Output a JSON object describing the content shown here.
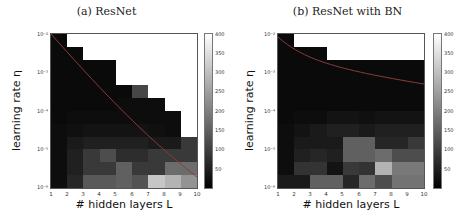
{
  "chart_data": [
    {
      "type": "heatmap",
      "title": "(a) ResNet",
      "xlabel": "# hidden layers L",
      "ylabel": "learning rate η",
      "x_ticks": [
        "1",
        "2",
        "3",
        "4",
        "5",
        "6",
        "7",
        "8",
        "9",
        "10"
      ],
      "y_ticks": [
        "10⁻²",
        "10⁻³",
        "10⁻⁴",
        "10⁻⁵",
        "10⁻⁶"
      ],
      "y_scale": "log",
      "xlim": [
        1,
        10
      ],
      "ylim": [
        1e-06,
        0.01
      ],
      "colorbar": {
        "min": 0,
        "max": 400,
        "ticks": [
          "50",
          "100",
          "150",
          "200",
          "250",
          "300",
          "350",
          "400"
        ],
        "colormap": "gray"
      },
      "note": "grid rows top (η=1e-2) to bottom (η=1e-6); columns L=1..9; null = diverged (white)",
      "grid": [
        [
          15,
          null,
          null,
          null,
          null,
          null,
          null,
          null,
          null
        ],
        [
          15,
          15,
          null,
          null,
          null,
          null,
          null,
          null,
          null
        ],
        [
          15,
          15,
          15,
          15,
          null,
          null,
          null,
          null,
          null
        ],
        [
          15,
          15,
          15,
          15,
          null,
          null,
          null,
          null,
          null
        ],
        [
          15,
          15,
          15,
          15,
          15,
          110,
          null,
          null,
          null
        ],
        [
          15,
          15,
          15,
          15,
          20,
          20,
          20,
          null,
          null
        ],
        [
          15,
          20,
          20,
          20,
          20,
          20,
          20,
          20,
          null
        ],
        [
          20,
          25,
          30,
          30,
          30,
          30,
          25,
          20,
          null
        ],
        [
          20,
          40,
          50,
          50,
          50,
          50,
          40,
          40,
          90
        ],
        [
          20,
          50,
          90,
          120,
          70,
          70,
          90,
          90,
          90
        ],
        [
          20,
          50,
          90,
          90,
          150,
          90,
          90,
          170,
          170
        ],
        [
          20,
          60,
          140,
          140,
          150,
          130,
          310,
          280,
          230
        ]
      ],
      "curve": {
        "color": "#8a3a3a",
        "points": [
          [
            1,
            0.01
          ],
          [
            10,
            2e-06
          ]
        ]
      }
    },
    {
      "type": "heatmap",
      "title": "(b) ResNet with BN",
      "xlabel": "# hidden layers L",
      "ylabel": "learning rate η",
      "x_ticks": [
        "1",
        "2",
        "3",
        "4",
        "5",
        "6",
        "7",
        "8",
        "9",
        "10"
      ],
      "y_ticks": [
        "10⁻²",
        "10⁻³",
        "10⁻⁴",
        "10⁻⁵",
        "10⁻⁶"
      ],
      "y_scale": "log",
      "xlim": [
        1,
        10
      ],
      "ylim": [
        1e-06,
        0.01
      ],
      "colorbar": {
        "min": 0,
        "max": 400,
        "ticks": [
          "50",
          "100",
          "150",
          "200",
          "250",
          "300",
          "350",
          "400"
        ],
        "colormap": "gray"
      },
      "note": "grid rows top (η=1e-2) to bottom (η=1e-6); columns L=1..9; null = diverged (white)",
      "grid": [
        [
          15,
          null,
          null,
          null,
          null,
          null,
          null,
          null,
          null
        ],
        [
          15,
          15,
          15,
          null,
          null,
          null,
          null,
          null,
          null
        ],
        [
          15,
          15,
          15,
          15,
          15,
          15,
          15,
          15,
          15
        ],
        [
          15,
          15,
          15,
          15,
          15,
          15,
          15,
          15,
          15
        ],
        [
          15,
          15,
          15,
          15,
          15,
          15,
          15,
          15,
          15
        ],
        [
          15,
          15,
          15,
          15,
          15,
          15,
          15,
          15,
          15
        ],
        [
          15,
          20,
          20,
          30,
          30,
          25,
          30,
          30,
          30
        ],
        [
          20,
          30,
          40,
          50,
          50,
          40,
          50,
          50,
          50
        ],
        [
          20,
          40,
          40,
          40,
          150,
          150,
          60,
          60,
          90
        ],
        [
          20,
          50,
          60,
          50,
          150,
          150,
          170,
          120,
          120
        ],
        [
          20,
          80,
          80,
          30,
          90,
          80,
          280,
          190,
          190
        ],
        [
          40,
          40,
          150,
          150,
          60,
          170,
          120,
          180,
          180
        ]
      ],
      "curve": {
        "color": "#8a3a3a",
        "points": [
          [
            1,
            0.009
          ],
          [
            10,
            0.0005
          ]
        ]
      }
    }
  ],
  "panels": [
    {
      "title": "(a) ResNet",
      "xlabel": "# hidden layers L",
      "ylabel": "learning rate η",
      "yticks": [
        "10⁻²",
        "10⁻³",
        "10⁻⁴",
        "10⁻⁵",
        "10⁻⁶"
      ],
      "xticks": [
        "1",
        "2",
        "3",
        "4",
        "5",
        "6",
        "7",
        "8",
        "9",
        "10"
      ],
      "cbticks": [
        "400",
        "350",
        "300",
        "250",
        "200",
        "150",
        "100",
        "50"
      ]
    },
    {
      "title": "(b) ResNet with BN",
      "xlabel": "# hidden layers L",
      "ylabel": "learning rate η",
      "yticks": [
        "10⁻²",
        "10⁻³",
        "10⁻⁴",
        "10⁻⁵",
        "10⁻⁶"
      ],
      "xticks": [
        "1",
        "2",
        "3",
        "4",
        "5",
        "6",
        "7",
        "8",
        "9",
        "10"
      ],
      "cbticks": [
        "400",
        "350",
        "300",
        "250",
        "200",
        "150",
        "100",
        "50"
      ]
    }
  ]
}
